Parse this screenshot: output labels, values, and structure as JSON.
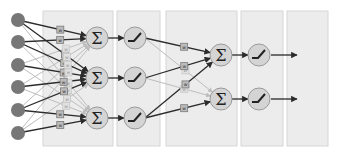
{
  "diagram": {
    "colors": {
      "panel_fill": "#ececec",
      "panel_stroke": "#d6d6d6",
      "input_node": "#777777",
      "neuron_fill": "#d4d4d4",
      "neuron_stroke": "#9a9a9a",
      "edge_dark": "#2b2b2b",
      "edge_light": "#bdbdbd",
      "weight_fill": "#bcbcbc",
      "weight_stroke": "#7a7a7a"
    },
    "panels": [
      {
        "x": 43,
        "y": 11,
        "w": 70,
        "h": 135
      },
      {
        "x": 117,
        "y": 11,
        "w": 43,
        "h": 135
      },
      {
        "x": 166,
        "y": 11,
        "w": 71,
        "h": 135
      },
      {
        "x": 241,
        "y": 11,
        "w": 42,
        "h": 135
      },
      {
        "x": 287,
        "y": 11,
        "w": 41,
        "h": 135
      }
    ],
    "inputs": [
      {
        "x": 18,
        "y": 20
      },
      {
        "x": 18,
        "y": 42
      },
      {
        "x": 18,
        "y": 65
      },
      {
        "x": 18,
        "y": 87
      },
      {
        "x": 18,
        "y": 110
      },
      {
        "x": 18,
        "y": 133
      }
    ],
    "sum_layer_1": [
      {
        "x": 97,
        "y": 38,
        "symbol": "Σ"
      },
      {
        "x": 97,
        "y": 78,
        "symbol": "Σ"
      },
      {
        "x": 97,
        "y": 118,
        "symbol": "Σ"
      }
    ],
    "act_layer_1": [
      {
        "x": 135,
        "y": 38
      },
      {
        "x": 135,
        "y": 78
      },
      {
        "x": 135,
        "y": 118
      }
    ],
    "sum_layer_2": [
      {
        "x": 221,
        "y": 55,
        "symbol": "Σ"
      },
      {
        "x": 221,
        "y": 99,
        "symbol": "Σ"
      }
    ],
    "act_layer_2": [
      {
        "x": 259,
        "y": 55
      },
      {
        "x": 259,
        "y": 99
      }
    ],
    "outputs": [
      {
        "x1": 271,
        "y1": 55,
        "x2": 297,
        "y2": 55
      },
      {
        "x1": 271,
        "y1": 99,
        "x2": 297,
        "y2": 99
      }
    ],
    "weight_label": "w",
    "node_radius": 11,
    "input_radius": 7
  }
}
